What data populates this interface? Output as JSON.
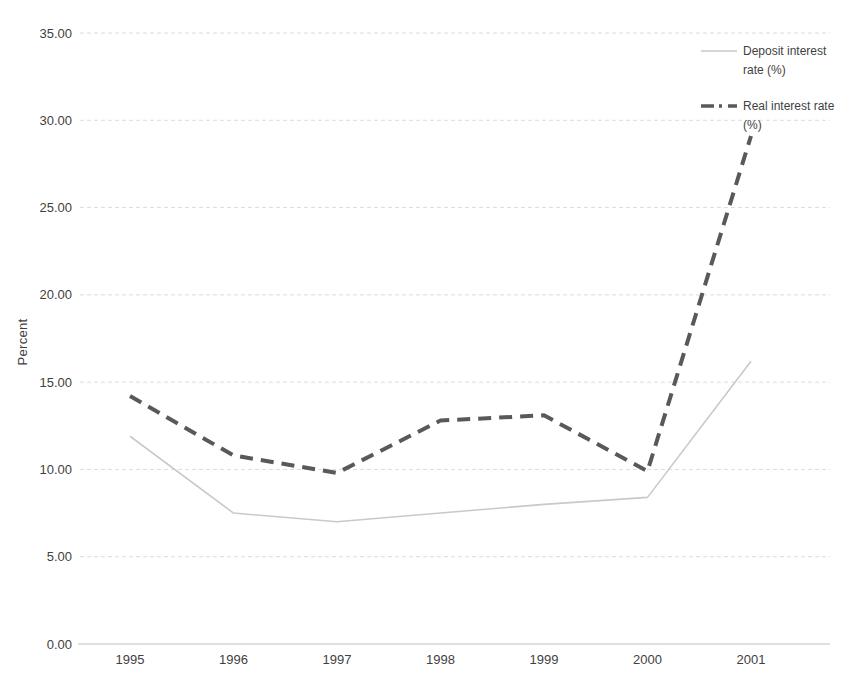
{
  "page": {
    "background": "#ffffff"
  },
  "chart_data": {
    "type": "line",
    "title": "",
    "xlabel": "",
    "ylabel": "Percent",
    "x": [
      "1995",
      "1996",
      "1997",
      "1998",
      "1999",
      "2000",
      "2001"
    ],
    "ylim": [
      0,
      35
    ],
    "ytick_step": 5,
    "ytick_labels": [
      "0.00",
      "5.00",
      "10.00",
      "15.00",
      "20.00",
      "25.00",
      "30.00",
      "35.00"
    ],
    "grid": "horizontal-dashed",
    "legend_position": "top-right",
    "series": [
      {
        "name": "Deposit interest rate (%)",
        "style": "solid",
        "color": "#c9c9c9",
        "width": 1.6,
        "values": [
          11.9,
          7.5,
          7.0,
          7.5,
          8.0,
          8.4,
          16.2
        ]
      },
      {
        "name": "Real interest rate (%)",
        "style": "dashed",
        "color": "#595959",
        "width": 4,
        "values": [
          14.2,
          10.8,
          9.8,
          12.8,
          13.1,
          9.9,
          29.1
        ]
      }
    ],
    "grid_color": "#dcdcdc",
    "axis_color": "#c0c0c0",
    "text_color": "#3f3f3f"
  }
}
